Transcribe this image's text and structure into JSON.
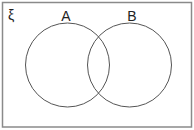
{
  "diagram": {
    "type": "venn",
    "universal_set_symbol": "ξ",
    "sets": [
      {
        "label": "A",
        "cx": 67.5,
        "cy": 65,
        "r": 42
      },
      {
        "label": "B",
        "cx": 129.5,
        "cy": 65,
        "r": 42
      }
    ],
    "colors": {
      "frame": "#8a8a8a",
      "circle": "#555555",
      "text": "#222222",
      "background": "#ffffff"
    }
  }
}
